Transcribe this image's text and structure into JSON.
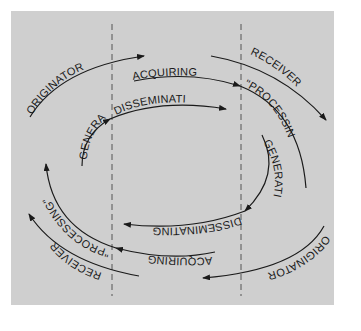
{
  "diagram": {
    "type": "cyclic information flow",
    "colors": {
      "background": "#ffffff",
      "panel": "#cfcfcf",
      "stroke": "#1a1a1a",
      "divider": "#555555"
    },
    "dividers": 2,
    "labels": {
      "originator_top": "ORIGINATOR",
      "acquiring_top": "ACQUIRING",
      "disseminating_top": "DISSEMINATING",
      "generating_left": "GENERATING",
      "receiver_top": "RECEIVER",
      "processing_top": "\"PROCESSING\"",
      "generating_right": "GENERATING",
      "disseminating_bottom": "DISSEMINATING",
      "acquiring_bottom": "ACQUIRING",
      "processing_bottom": "\"PROCESSING\"",
      "receiver_bottom": "RECEIVER",
      "originator_bottom": "ORIGINATOR"
    }
  }
}
